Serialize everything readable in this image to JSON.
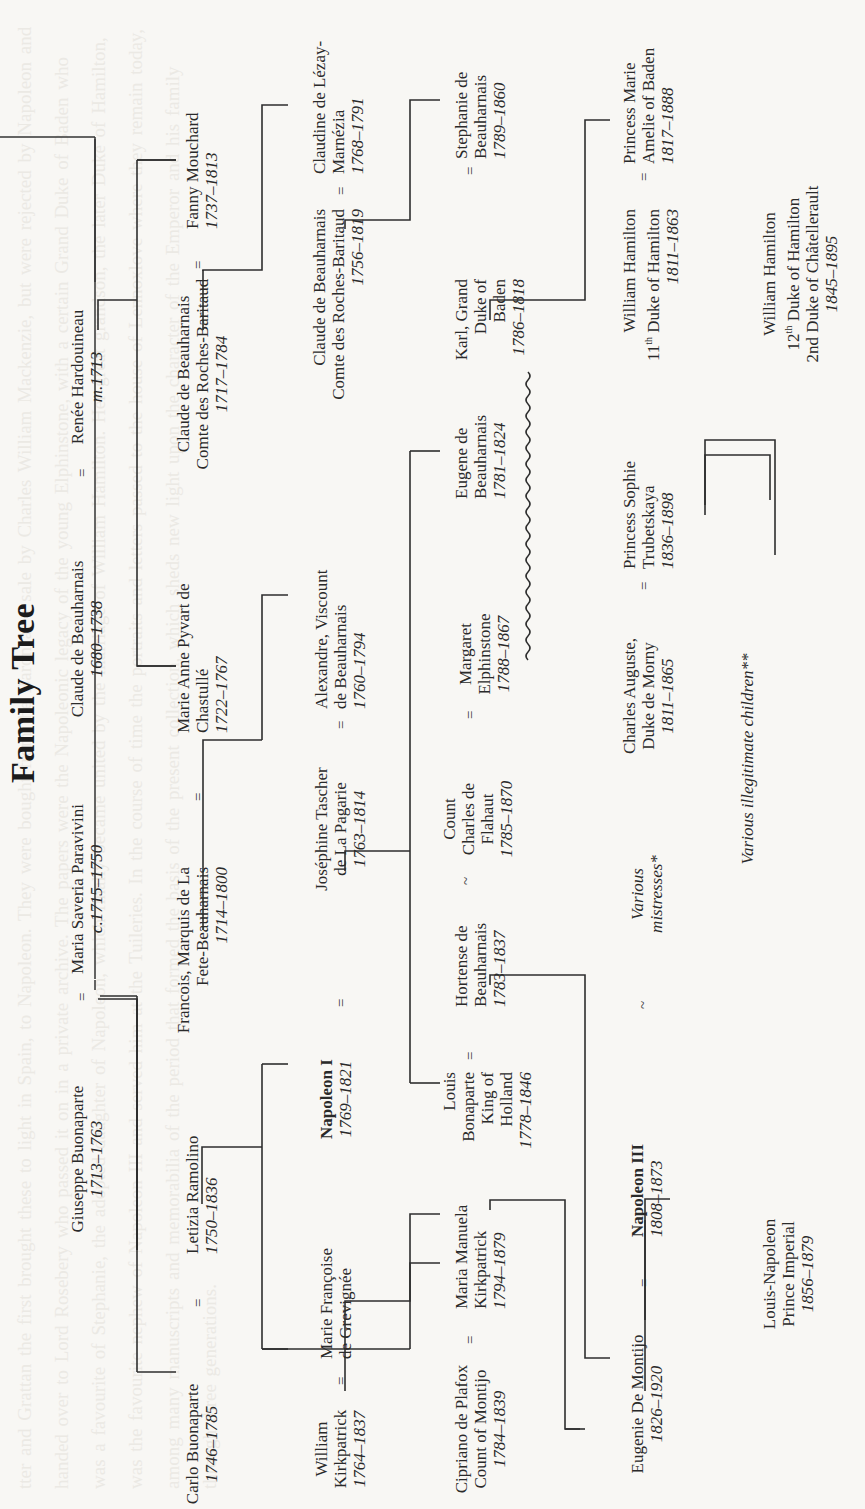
{
  "page": {
    "title": "Family Tree",
    "orientation": "rotated 90° counter-clockwise (landscape chart on portrait page)"
  },
  "people": {
    "giuseppe": {
      "name": "Giuseppe Buonaparte",
      "dates": "1713–1763"
    },
    "maria_saveria": {
      "name": "Maria Saveria Paravivini",
      "dates": "c.1715–1750"
    },
    "claude_1680": {
      "name": "Claude de Beauharnais",
      "dates": "1680–1738"
    },
    "renee": {
      "name": "Renée Hardouineau",
      "dates": "m.1713"
    },
    "carlo": {
      "name": "Carlo Buonaparte",
      "dates": "1746–1785"
    },
    "letizia": {
      "name": "Letizia Ramolino",
      "dates": "1750–1836"
    },
    "francois_l1": "Francois, Marquis de La",
    "francois_l2": "Fete-Beauharnais",
    "francois_dates": "1714–1800",
    "marie_anne_l1": "Marie Anne Pyvart de",
    "marie_anne_l2": "Chastullé",
    "marie_anne_dates": "1722–1767",
    "claude_1717_l1": "Claude de Beauharnais",
    "claude_1717_l2": "Comte des Roches-Baritaud",
    "claude_1717_dates": "1717–1784",
    "fanny": {
      "name": "Fanny Mouchard",
      "dates": "1737–1813"
    },
    "william_k_l1": "William",
    "william_k_l2": "Kirkpatrick",
    "william_k_dates": "1764–1837",
    "marie_fr_l1": "Marie Françoise",
    "marie_fr_l2": "de Grevignée",
    "napoleon1": {
      "name": "Napoleon I",
      "dates": "1769–1821"
    },
    "josephine_l1": "Joséphine Tascher",
    "josephine_l2": "de La Pagarie",
    "josephine_dates": "1763–1814",
    "alexandre_l1": "Alexandre, Viscount",
    "alexandre_l2": "de Beauharnais",
    "alexandre_dates": "1760–1794",
    "claude_1756_l1": "Claude de Beauharnais",
    "claude_1756_l2": "Comte des Roches-Baritaud",
    "claude_1756_dates": "1756–1819",
    "claudine_l1": "Claudine de Lézay-",
    "claudine_l2": "Marnézia",
    "claudine_dates": "1768–1791",
    "cipriano_l1": "Cipriano de Plafox",
    "cipriano_l2": "Count of Montijo",
    "cipriano_dates": "1784–1839",
    "maria_manuela_l1": "Maria Manuela",
    "maria_manuela_l2": "Kirkpatrick",
    "maria_manuela_dates": "1794–1879",
    "louis_l1": "Louis",
    "louis_l2": "Bonaparte",
    "louis_l3": "King of",
    "louis_l4": "Holland",
    "louis_dates": "1778–1846",
    "hortense_l1": "Hortense de",
    "hortense_l2": "Beauharnais",
    "hortense_dates": "1783–1837",
    "charles_flahaut_l1": "Count",
    "charles_flahaut_l2": "Charles de",
    "charles_flahaut_l3": "Flahaut",
    "charles_flahaut_dates": "1785–1870",
    "margaret_l1": "Margaret",
    "margaret_l2": "Elphinstone",
    "margaret_dates": "1788–1867",
    "eugene_l1": "Eugene de",
    "eugene_l2": "Beauharnais",
    "eugene_dates": "1781–1824",
    "karl_l1": "Karl, Grand",
    "karl_l2": "Duke of",
    "karl_l3": "Baden",
    "karl_dates": "1786–1818",
    "stephanie_l1": "Stephanie de",
    "stephanie_l2": "Beauharnais",
    "stephanie_dates": "1789–1860",
    "eugenie": {
      "name": "Eugenie De Montijo",
      "dates": "1826–1920"
    },
    "napoleon3": {
      "name": "Napoleon III",
      "dates": "1808–1873"
    },
    "various_mistresses_l1": "Various",
    "various_mistresses_l2": "mistresses*",
    "morny_l1": "Charles Auguste,",
    "morny_l2": "Duke de Morny",
    "morny_dates": "1811–1865",
    "sophie_l1": "Princess Sophie",
    "sophie_l2": "Trubetskaya",
    "sophie_dates": "1836–1898",
    "william_h11_l1": "William Hamilton",
    "william_h11_l2": "11th Duke of Hamilton",
    "william_h11_dates": "1811–1863",
    "marie_amelie_l1": "Princess Marie",
    "marie_amelie_l2": "Amelie of Baden",
    "marie_amelie_dates": "1817–1888",
    "louis_napoleon_l1": "Louis-Napoleon",
    "louis_napoleon_l2": "Prince Imperial",
    "louis_napoleon_dates": "1856–1879",
    "various_children": "Various illegitimate children**",
    "william_h12_l1": "William Hamilton",
    "william_h12_l2": "12th Duke of Hamilton",
    "william_h12_l3": "2nd Duke of Châtellerault",
    "william_h12_dates": "1845–1895"
  },
  "symbols": {
    "married": "=",
    "liaison": "~"
  },
  "ghost_text": "tter and Grattan the first brought these to light in Spain, to Napoleon. They were bought from the Baron at a sale by Charles William Mackenzie, but were rejected by Napoleon and handed over to Lord Rosebery who passed it on in a private archive. The papers were the Napoleonic legacy of the young Elphinstone, with a certain Grand Duke of Baden who was a favourite of Stephanie, the adopted daughter of Napoleon, which finally became united by the marriage of William Hamilton. Her great grandson, the later Duke of Hamilton, was the favourite nephew of Napoleon III and served him at the Tuileries. In the course of time the portraits and letters passed to the house of Lennoxlove where they remain today, among many manuscripts and memorabilia of the period that formed the basis of the present collection, which sheds new light upon the character of the Emperor and his family through three generations."
}
